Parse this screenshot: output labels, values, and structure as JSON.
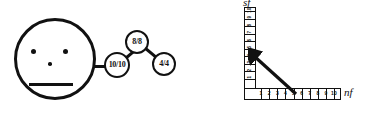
{
  "face_diagram": {
    "face": {
      "eye_left": "eye",
      "eye_right": "eye",
      "nose": "nose",
      "mouth": "mouth"
    },
    "nodes": [
      {
        "id": "node-a",
        "label": "10/10"
      },
      {
        "id": "node-b",
        "label": "8/8"
      },
      {
        "id": "node-c",
        "label": "4/4"
      }
    ]
  },
  "chart_data": {
    "type": "scatter",
    "title": "",
    "xlabel": "nf",
    "ylabel": "sf",
    "x_ticks": [
      "1",
      "2",
      "3",
      "4",
      "5",
      "6",
      "7",
      "8",
      "9",
      "10"
    ],
    "y_ticks": [
      "1",
      "2",
      "3",
      "4",
      "5",
      "6",
      "7",
      "8",
      "9",
      "10"
    ],
    "xlim": [
      0,
      10
    ],
    "ylim": [
      0,
      10
    ],
    "grid": false,
    "legend": "none",
    "annotations": [
      {
        "kind": "arrow",
        "label": "",
        "from_x": 6,
        "from_y": 0,
        "to_x": 1,
        "to_y": 4
      }
    ]
  },
  "colors": {
    "ink": "#111111",
    "background": "#ffffff"
  }
}
